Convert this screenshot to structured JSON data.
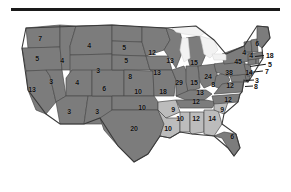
{
  "figure": {
    "type": "choropleth-map",
    "title": "",
    "divider": "horizontal-rule"
  },
  "colors": {
    "dark_fill": "#7c7c7c",
    "light_fill": "#bcbcbc",
    "water_fill": "#f2f2f2",
    "border": "#4a4a4a",
    "outline": "#3a3a3a",
    "label_text": "#111111",
    "rule": "#1a1a1a",
    "page_background": "#ffffff"
  },
  "chart_data": {
    "type": "map",
    "title": "",
    "xlabel": "",
    "ylabel": "",
    "legend": [],
    "categories": [
      "WA",
      "OR",
      "CA",
      "NV",
      "ID",
      "MT",
      "WY",
      "UT",
      "AZ",
      "NM",
      "CO",
      "ND",
      "SD",
      "NE",
      "KS",
      "OK",
      "TX",
      "MN",
      "IA",
      "MO",
      "AR",
      "LA",
      "WI",
      "IL",
      "MI",
      "IN",
      "OH",
      "KY",
      "TN",
      "MS",
      "AL",
      "GA",
      "FL",
      "SC",
      "NC",
      "VA",
      "WV",
      "MD",
      "DE",
      "PA",
      "NJ",
      "NY",
      "CT",
      "RI",
      "MA",
      "VT",
      "NH",
      "ME"
    ],
    "values": [
      7,
      5,
      13,
      3,
      4,
      4,
      3,
      4,
      3,
      3,
      6,
      5,
      5,
      8,
      10,
      10,
      20,
      12,
      13,
      18,
      9,
      10,
      13,
      29,
      15,
      15,
      24,
      13,
      12,
      10,
      12,
      14,
      6,
      9,
      12,
      12,
      8,
      8,
      3,
      38,
      14,
      45,
      7,
      5,
      18,
      4,
      4,
      6
    ],
    "shading": {
      "dark": [
        "WA",
        "OR",
        "CA",
        "NV",
        "ID",
        "MT",
        "WY",
        "UT",
        "AZ",
        "NM",
        "CO",
        "ND",
        "SD",
        "NE",
        "KS",
        "OK",
        "TX",
        "MN",
        "IA",
        "MO",
        "WI",
        "IL",
        "MI",
        "IN",
        "OH",
        "KY",
        "TN",
        "NC",
        "VA",
        "WV",
        "MD",
        "DE",
        "PA",
        "NJ",
        "NY",
        "CT",
        "RI",
        "MA",
        "VT",
        "NH",
        "ME",
        "FL"
      ],
      "light": [
        "AR",
        "LA",
        "MS",
        "AL",
        "GA",
        "SC"
      ]
    }
  },
  "labels": [
    {
      "id": "WA",
      "text": "7",
      "x": 40,
      "y": 24,
      "lead": false
    },
    {
      "id": "MT",
      "text": "4",
      "x": 89,
      "y": 31,
      "lead": false
    },
    {
      "id": "ND",
      "text": "5",
      "x": 124,
      "y": 33,
      "lead": false
    },
    {
      "id": "MN",
      "text": "12",
      "x": 152,
      "y": 38,
      "lead": false
    },
    {
      "id": "OR",
      "text": "5",
      "x": 37,
      "y": 44,
      "lead": false
    },
    {
      "id": "ID",
      "text": "4",
      "x": 62,
      "y": 46,
      "lead": false
    },
    {
      "id": "SD",
      "text": "5",
      "x": 126,
      "y": 46,
      "lead": false
    },
    {
      "id": "WI",
      "text": "13",
      "x": 170,
      "y": 46,
      "lead": false
    },
    {
      "id": "MI",
      "text": "15",
      "x": 194,
      "y": 48,
      "lead": false
    },
    {
      "id": "ME",
      "text": "6",
      "x": 257,
      "y": 29,
      "lead": false
    },
    {
      "id": "NH",
      "text": "4",
      "x": 244,
      "y": 38,
      "lead": false
    },
    {
      "id": "VT",
      "text": "4",
      "x": 251,
      "y": 41,
      "lead": false
    },
    {
      "id": "NY",
      "text": "45",
      "x": 238,
      "y": 47,
      "lead": false
    },
    {
      "id": "WY",
      "text": "3",
      "x": 98,
      "y": 56,
      "lead": false
    },
    {
      "id": "IA",
      "text": "13",
      "x": 157,
      "y": 58,
      "lead": false
    },
    {
      "id": "PA",
      "text": "38",
      "x": 229,
      "y": 58,
      "lead": false
    },
    {
      "id": "NE",
      "text": "8",
      "x": 130,
      "y": 62,
      "lead": false
    },
    {
      "id": "OH",
      "text": "24",
      "x": 208,
      "y": 62,
      "lead": false
    },
    {
      "id": "NV",
      "text": "3",
      "x": 51,
      "y": 67,
      "lead": false
    },
    {
      "id": "UT",
      "text": "4",
      "x": 77,
      "y": 68,
      "lead": false
    },
    {
      "id": "IL",
      "text": "29",
      "x": 179,
      "y": 68,
      "lead": false
    },
    {
      "id": "IN",
      "text": "15",
      "x": 194,
      "y": 68,
      "lead": false
    },
    {
      "id": "CA",
      "text": "13",
      "x": 32,
      "y": 75,
      "lead": false
    },
    {
      "id": "CO",
      "text": "6",
      "x": 104,
      "y": 74,
      "lead": false
    },
    {
      "id": "WV",
      "text": "8",
      "x": 213,
      "y": 70,
      "lead": false
    },
    {
      "id": "VA",
      "text": "12",
      "x": 230,
      "y": 71,
      "lead": false
    },
    {
      "id": "KS",
      "text": "10",
      "x": 138,
      "y": 77,
      "lead": false
    },
    {
      "id": "MO",
      "text": "18",
      "x": 163,
      "y": 77,
      "lead": false
    },
    {
      "id": "KY",
      "text": "13",
      "x": 200,
      "y": 78,
      "lead": false
    },
    {
      "id": "TN",
      "text": "12",
      "x": 196,
      "y": 87,
      "lead": false
    },
    {
      "id": "NC",
      "text": "12",
      "x": 228,
      "y": 85,
      "lead": false
    },
    {
      "id": "OK",
      "text": "10",
      "x": 142,
      "y": 93,
      "lead": false
    },
    {
      "id": "AR",
      "text": "9",
      "x": 173,
      "y": 95,
      "lead": false
    },
    {
      "id": "SC",
      "text": "9",
      "x": 222,
      "y": 95,
      "lead": false
    },
    {
      "id": "AZ",
      "text": "3",
      "x": 69,
      "y": 97,
      "lead": false
    },
    {
      "id": "NM",
      "text": "3",
      "x": 97,
      "y": 97,
      "lead": false
    },
    {
      "id": "MS",
      "text": "10",
      "x": 180,
      "y": 104,
      "lead": false
    },
    {
      "id": "AL",
      "text": "12",
      "x": 196,
      "y": 104,
      "lead": false
    },
    {
      "id": "GA",
      "text": "14",
      "x": 212,
      "y": 104,
      "lead": false
    },
    {
      "id": "TX",
      "text": "20",
      "x": 134,
      "y": 114,
      "lead": false
    },
    {
      "id": "LA",
      "text": "10",
      "x": 168,
      "y": 114,
      "lead": false
    },
    {
      "id": "FL",
      "text": "6",
      "x": 232,
      "y": 122,
      "lead": false
    },
    {
      "id": "MA",
      "text": "18",
      "x": 266,
      "y": 41,
      "lead": true
    },
    {
      "id": "RI",
      "text": "5",
      "x": 268,
      "y": 50,
      "lead": true
    },
    {
      "id": "CT",
      "text": "7",
      "x": 265,
      "y": 57,
      "lead": true
    },
    {
      "id": "NJ",
      "text": "14",
      "x": 249,
      "y": 58,
      "lead": false
    },
    {
      "id": "DE",
      "text": "3",
      "x": 255,
      "y": 66,
      "lead": true
    },
    {
      "id": "MD",
      "text": "8",
      "x": 254,
      "y": 72,
      "lead": true
    }
  ],
  "leaders": [
    {
      "id": "MA-leader",
      "x": 255,
      "y": 42,
      "w": 9,
      "a": -6
    },
    {
      "id": "RI-leader",
      "x": 250,
      "y": 52,
      "w": 16,
      "a": -8
    },
    {
      "id": "CT-leader",
      "x": 249,
      "y": 58,
      "w": 14,
      "a": -6
    },
    {
      "id": "DE-leader",
      "x": 246,
      "y": 66,
      "w": 8,
      "a": -4
    },
    {
      "id": "MD-leader",
      "x": 245,
      "y": 72,
      "w": 8,
      "a": -3
    }
  ]
}
